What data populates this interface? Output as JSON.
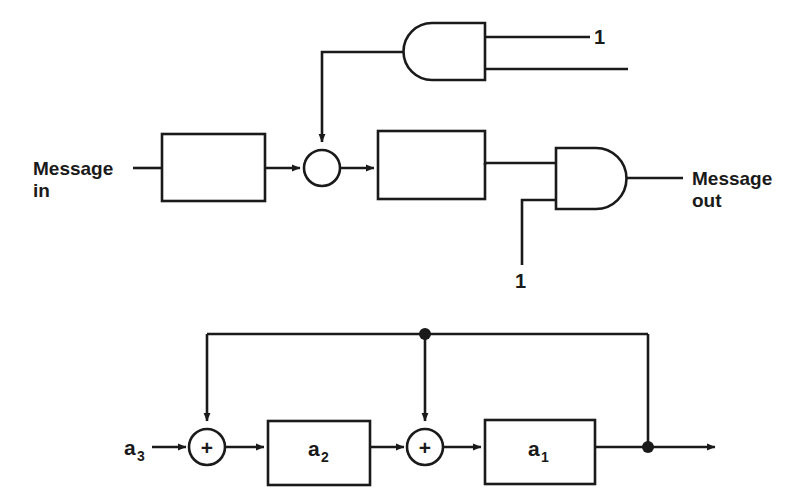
{
  "figure": {
    "background_color": "#ffffff",
    "line_color": "#1a1a1a"
  },
  "diagram_top": {
    "name": "scrambler-block-diagram",
    "labels": {
      "message_in_line1": "Message",
      "message_in_line2": "in",
      "message_out_line1": "Message",
      "message_out_line2": "out",
      "gate_top_constant": "1",
      "gate_bottom_constant": "1"
    },
    "nodes": [
      {
        "id": "input-block",
        "type": "rect",
        "label": ""
      },
      {
        "id": "summing-junction",
        "type": "circle",
        "label": ""
      },
      {
        "id": "shift-register-block",
        "type": "rect",
        "label": ""
      },
      {
        "id": "and-gate-upper",
        "type": "and-gate-mirrored",
        "label": ""
      },
      {
        "id": "and-gate-output",
        "type": "and-gate",
        "label": ""
      }
    ]
  },
  "diagram_bottom": {
    "name": "feedback-shift-register-diagram",
    "labels": {
      "input": "a",
      "input_sub": "3",
      "coef_2": "a",
      "coef_2_sub": "2",
      "coef_1": "a",
      "coef_1_sub": "1",
      "adder_symbol_1": "+",
      "adder_symbol_2": "+"
    },
    "nodes": [
      {
        "id": "adder-1",
        "type": "circle-plus",
        "label": "+"
      },
      {
        "id": "block-a2",
        "type": "rect",
        "label": "a2"
      },
      {
        "id": "adder-2",
        "type": "circle-plus",
        "label": "+"
      },
      {
        "id": "block-a1",
        "type": "rect",
        "label": "a1"
      },
      {
        "id": "tap-dot-mid",
        "type": "junction-dot",
        "label": ""
      },
      {
        "id": "tap-dot-right",
        "type": "junction-dot",
        "label": ""
      }
    ]
  }
}
